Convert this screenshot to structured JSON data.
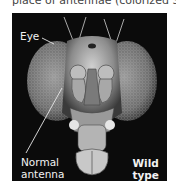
{
  "caption": "place of antennae (colorized SEMs)",
  "figure": {
    "image_description": "scanning electron micrograph of a fruit fly head, front view",
    "labels": {
      "eye": "Eye",
      "antenna_line1": "Normal",
      "antenna_line2": "antenna",
      "type_line1": "Wild",
      "type_line2": "type"
    },
    "colors": {
      "background": "#0b0b0b",
      "label_text": "#f2f2f2"
    }
  }
}
